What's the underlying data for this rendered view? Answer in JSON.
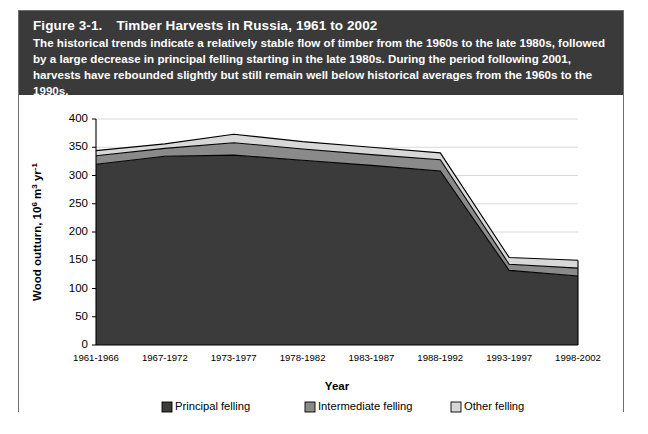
{
  "figure": {
    "label": "Figure 3-1.",
    "title": "Timber Harvests in Russia, 1961 to 2002",
    "caption": "The historical trends indicate a relatively stable flow of timber from the 1960s to the late 1980s, followed by a large decrease in principal felling starting in the late 1980s. During the period following 2001, harvests have rebounded slightly but still remain well below historical averages from the 1960s to the 1990s."
  },
  "colors": {
    "header_background": "#3a3a3a",
    "header_text": "#ffffff",
    "principal_felling": "#3b3b3b",
    "intermediate_felling": "#8a8a8a",
    "other_felling": "#d8d8d8",
    "gridline": "#cfcfcf",
    "axis": "#000000"
  },
  "chart_data": {
    "type": "area",
    "stacked": true,
    "title": "Timber Harvests in Russia, 1961 to 2002",
    "xlabel": "Year",
    "ylabel": "Wood outturn, 10⁶ m³ yr⁻¹",
    "categories": [
      "1961-1966",
      "1967-1972",
      "1973-1977",
      "1978-1982",
      "1983-1987",
      "1988-1992",
      "1993-1997",
      "1998-2002"
    ],
    "series": [
      {
        "name": "Principal felling",
        "color": "#3b3b3b",
        "values": [
          320,
          334,
          336,
          327,
          318,
          308,
          132,
          122
        ]
      },
      {
        "name": "Intermediate felling",
        "color": "#8a8a8a",
        "values": [
          15,
          14,
          22,
          20,
          19,
          20,
          11,
          14
        ]
      },
      {
        "name": "Other felling",
        "color": "#d8d8d8",
        "values": [
          9,
          8,
          15,
          13,
          13,
          12,
          12,
          14
        ]
      }
    ],
    "totals": [
      344,
      356,
      373,
      360,
      350,
      340,
      155,
      150
    ],
    "ylim": [
      0,
      400
    ],
    "yticks": [
      0,
      50,
      100,
      150,
      200,
      250,
      300,
      350,
      400
    ],
    "ytick_labels": [
      "0",
      "50",
      "100",
      "150",
      "200",
      "250",
      "300",
      "350",
      "400"
    ],
    "grid": true,
    "legend_position": "bottom"
  },
  "legend": {
    "items": [
      {
        "label": "Principal felling",
        "color": "#3b3b3b"
      },
      {
        "label": "Intermediate felling",
        "color": "#8a8a8a"
      },
      {
        "label": "Other felling",
        "color": "#d8d8d8"
      }
    ]
  }
}
